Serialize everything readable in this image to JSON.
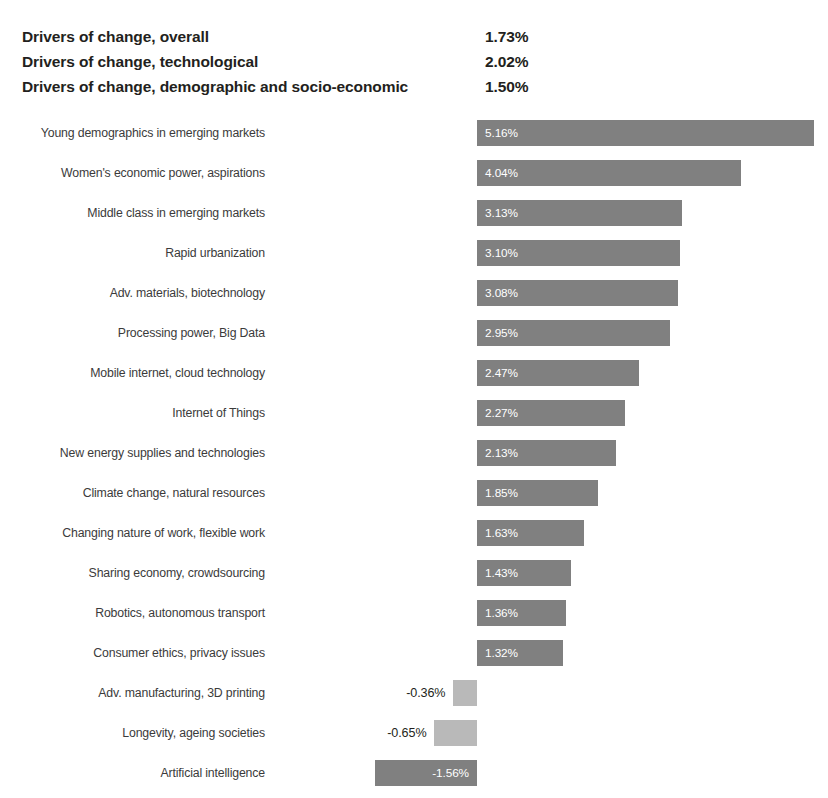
{
  "summary": {
    "rows": [
      {
        "label": "Drivers of change, overall",
        "value": "1.73%"
      },
      {
        "label": "Drivers of change, technological",
        "value": "2.02%"
      },
      {
        "label": "Drivers of change, demographic and socio-economic",
        "value": "1.50%"
      }
    ]
  },
  "colors": {
    "bar_positive": "#808080",
    "bar_negative_dark": "#808080",
    "bar_negative_light": "#b9b9b9",
    "label_text": "#3b3b3b",
    "value_text_inside": "#ffffff",
    "value_text_outside": "#231f20",
    "background": "#ffffff"
  },
  "chart_data": {
    "type": "bar",
    "orientation": "horizontal",
    "title": "",
    "subtitle": "",
    "xlabel": "",
    "ylabel": "",
    "grid": false,
    "legend": null,
    "xlim": [
      -2.0,
      5.5
    ],
    "baseline": 0,
    "value_suffix": "%",
    "categories": [
      "Young demographics in emerging markets",
      "Women's economic power, aspirations",
      "Middle class in emerging markets",
      "Rapid urbanization",
      "Adv. materials, biotechnology",
      "Processing power, Big Data",
      "Mobile internet, cloud technology",
      "Internet of Things",
      "New energy supplies and technologies",
      "Climate change, natural resources",
      "Changing nature of work, flexible work",
      "Sharing economy, crowdsourcing",
      "Robotics, autonomous transport",
      "Consumer ethics, privacy issues",
      "Adv. manufacturing, 3D printing",
      "Longevity, ageing societies",
      "Artificial intelligence"
    ],
    "values": [
      5.16,
      4.04,
      3.13,
      3.1,
      3.08,
      2.95,
      2.47,
      2.27,
      2.13,
      1.85,
      1.63,
      1.43,
      1.36,
      1.32,
      -0.36,
      -0.65,
      -1.56
    ],
    "labels": [
      "5.16%",
      "4.04%",
      "3.13%",
      "3.10%",
      "3.08%",
      "2.95%",
      "2.47%",
      "2.27%",
      "2.13%",
      "1.85%",
      "1.63%",
      "1.43%",
      "1.36%",
      "1.32%",
      "-0.36%",
      "-0.65%",
      "-1.56%"
    ],
    "bar_styles": [
      "pos",
      "pos",
      "pos",
      "pos",
      "pos",
      "pos",
      "pos",
      "pos",
      "pos",
      "pos",
      "pos",
      "pos",
      "pos",
      "pos",
      "neg-light",
      "neg-light",
      "neg-dark"
    ],
    "label_placement": [
      "inside",
      "inside",
      "inside",
      "inside",
      "inside",
      "inside",
      "inside",
      "inside",
      "inside",
      "inside",
      "inside",
      "inside",
      "inside",
      "inside",
      "outside",
      "outside",
      "inside"
    ]
  }
}
